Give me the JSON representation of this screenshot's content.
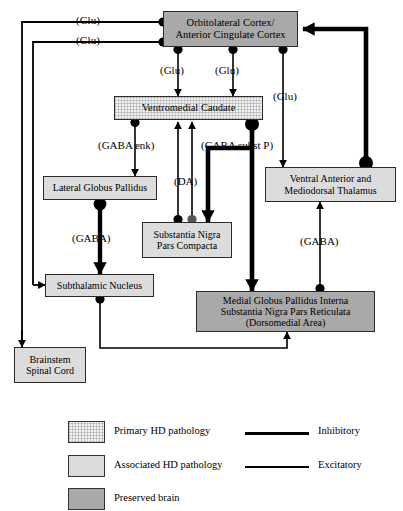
{
  "diagram": {
    "nodes": {
      "cortex": {
        "line1": "Orbitolateral Cortex/",
        "line2": "Anterior Cingulate Cortex",
        "fill": "preserved"
      },
      "caudate": {
        "line1": "Ventromedial Caudate",
        "fill": "primary"
      },
      "lateral_globus_pallidus": {
        "line1": "Lateral Globus Pallidus",
        "fill": "associated"
      },
      "substantia_nigra_pars_compacta": {
        "line1": "Substantia Nigra",
        "line2": "Pars Compacta",
        "fill": "associated"
      },
      "thalamus": {
        "line1": "Ventral Anterior and",
        "line2": "Mediodorsal Thalamus",
        "fill": "associated"
      },
      "subthalamic_nucleus": {
        "line1": "Subthalamic Nucleus",
        "fill": "associated"
      },
      "brainstem": {
        "line1": "Brainstem",
        "line2": "Spinal Cord",
        "fill": "associated"
      },
      "medial_globus_pallidus": {
        "line1": "Medial Globus Pallidus Interna",
        "line2": "Substantia Nigra Pars Reticulata",
        "line3": "(Dorsomedial Area)",
        "fill": "preserved"
      }
    },
    "edge_labels": {
      "glu_top_left": "(Glu)",
      "glu_second_left": "(Glu)",
      "glu_caudate_left": "(Glu)",
      "glu_caudate_right": "(Glu)",
      "glu_thalamus": "(Glu)",
      "gaba_enk": "(GABA enk)",
      "gaba_subst_p": "(GABA subst P)",
      "da": "(DA)",
      "gaba_lgp": "(GABA)",
      "gaba_mgp_thal": "(GABA)"
    }
  },
  "legend": {
    "items": [
      {
        "label": "Primary HD pathology",
        "fill": "primary"
      },
      {
        "label": "Associated HD pathology",
        "fill": "associated"
      },
      {
        "label": "Preserved brain",
        "fill": "preserved"
      }
    ],
    "lines": [
      {
        "label": "Inhibitory",
        "style": "thin"
      },
      {
        "label": "Excitatory",
        "style": "thick"
      }
    ]
  },
  "colors": {
    "primary_fill": "#f2f2f2",
    "associated_fill": "#dcdcdc",
    "preserved_fill": "#a9a9a9",
    "stroke": "#000000"
  }
}
